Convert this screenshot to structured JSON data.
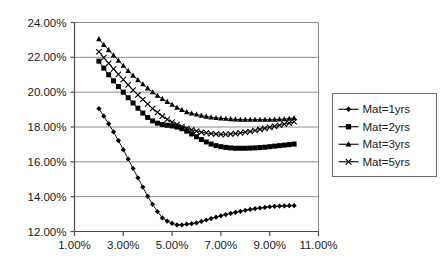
{
  "chart_data": {
    "type": "line",
    "title": "",
    "subtitle": "",
    "xlabel": "",
    "ylabel": "",
    "xlim": [
      1.0,
      11.0
    ],
    "ylim": [
      12.0,
      24.0
    ],
    "x_tick_labels": [
      "1.00%",
      "3.00%",
      "5.00%",
      "7.00%",
      "9.00%",
      "11.00%"
    ],
    "x_ticks": [
      1.0,
      3.0,
      5.0,
      7.0,
      9.0,
      11.0
    ],
    "y_tick_labels": [
      "12.00%",
      "14.00%",
      "16.00%",
      "18.00%",
      "20.00%",
      "22.00%",
      "24.00%"
    ],
    "y_ticks": [
      12.0,
      14.0,
      16.0,
      18.0,
      20.0,
      22.0,
      24.0
    ],
    "grid": "horizontal",
    "legend_position": "right",
    "x": [
      2.0,
      2.2,
      2.4,
      2.6,
      2.8,
      3.0,
      3.2,
      3.4,
      3.6,
      3.8,
      4.0,
      4.2,
      4.4,
      4.6,
      4.8,
      5.0,
      5.2,
      5.4,
      5.6,
      5.8,
      6.0,
      6.2,
      6.4,
      6.6,
      6.8,
      7.0,
      7.2,
      7.4,
      7.6,
      7.8,
      8.0,
      8.2,
      8.4,
      8.6,
      8.8,
      9.0,
      9.2,
      9.4,
      9.6,
      9.8,
      10.0
    ],
    "series": [
      {
        "name": "Mat=1yrs",
        "marker": "diamond",
        "values": [
          19.05,
          18.62,
          18.18,
          17.72,
          17.22,
          16.7,
          16.16,
          15.62,
          15.08,
          14.55,
          14.02,
          13.56,
          13.14,
          12.78,
          12.6,
          12.47,
          12.38,
          12.38,
          12.42,
          12.45,
          12.5,
          12.58,
          12.66,
          12.74,
          12.82,
          12.9,
          12.97,
          13.04,
          13.1,
          13.16,
          13.22,
          13.27,
          13.31,
          13.35,
          13.38,
          13.42,
          13.44,
          13.46,
          13.47,
          13.48,
          13.48
        ]
      },
      {
        "name": "Mat=2yrs",
        "marker": "square",
        "values": [
          21.78,
          21.38,
          21.0,
          20.65,
          20.32,
          20.0,
          19.68,
          19.38,
          19.08,
          18.8,
          18.55,
          18.35,
          18.22,
          18.14,
          18.1,
          18.06,
          18.0,
          17.9,
          17.76,
          17.6,
          17.44,
          17.28,
          17.14,
          17.02,
          16.93,
          16.87,
          16.83,
          16.8,
          16.78,
          16.78,
          16.78,
          16.79,
          16.8,
          16.82,
          16.84,
          16.87,
          16.9,
          16.93,
          16.96,
          16.99,
          17.02
        ]
      },
      {
        "name": "Mat=3yrs",
        "marker": "triangle",
        "values": [
          23.05,
          22.72,
          22.42,
          22.12,
          21.82,
          21.52,
          21.22,
          20.95,
          20.7,
          20.46,
          20.22,
          20.0,
          19.8,
          19.62,
          19.45,
          19.28,
          19.12,
          18.98,
          18.86,
          18.78,
          18.72,
          18.66,
          18.6,
          18.56,
          18.52,
          18.5,
          18.48,
          18.46,
          18.44,
          18.42,
          18.42,
          18.42,
          18.42,
          18.42,
          18.42,
          18.42,
          18.43,
          18.44,
          18.46,
          18.48,
          18.52
        ]
      },
      {
        "name": "Mat=5yrs",
        "marker": "x",
        "values": [
          22.32,
          21.98,
          21.66,
          21.34,
          21.02,
          20.72,
          20.42,
          20.12,
          19.84,
          19.58,
          19.32,
          19.06,
          18.84,
          18.62,
          18.44,
          18.28,
          18.14,
          18.02,
          17.92,
          17.84,
          17.76,
          17.7,
          17.66,
          17.62,
          17.6,
          17.58,
          17.58,
          17.6,
          17.62,
          17.66,
          17.7,
          17.74,
          17.8,
          17.86,
          17.92,
          17.98,
          18.04,
          18.1,
          18.16,
          18.22,
          18.3
        ]
      }
    ]
  },
  "legend": {
    "items": [
      {
        "label": "Mat=1yrs",
        "marker": "diamond"
      },
      {
        "label": "Mat=2yrs",
        "marker": "square"
      },
      {
        "label": "Mat=3yrs",
        "marker": "triangle"
      },
      {
        "label": "Mat=5yrs",
        "marker": "x"
      }
    ]
  },
  "colors": {
    "series": "#000000",
    "gridline": "#8c8c8c",
    "axis": "#4d4d4d",
    "background": "#ffffff",
    "text": "#1a1a1a"
  }
}
